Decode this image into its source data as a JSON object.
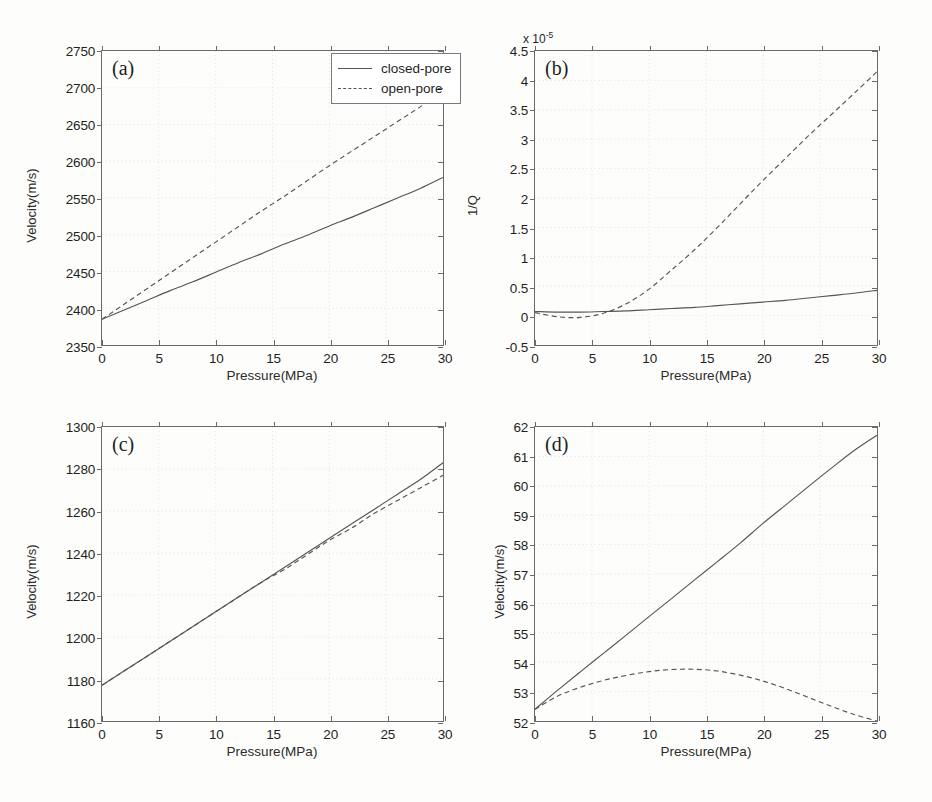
{
  "figure": {
    "background": "#fdfdfb",
    "axis_color": "#6a6a6a",
    "curve_color": "#555555"
  },
  "legend": {
    "entries": [
      {
        "label": "closed-pore",
        "style": "solid"
      },
      {
        "label": "open-pore",
        "style": "dashed"
      }
    ],
    "position": "top-right of panel (a)"
  },
  "chart_data": [
    {
      "type": "line",
      "panel": "a",
      "tag": "(a)",
      "title": "",
      "xlabel": "Pressure(MPa)",
      "ylabel": "Velocity(m/s)",
      "xlim": [
        0,
        30
      ],
      "ylim": [
        2350,
        2750
      ],
      "xticks": [
        0,
        5,
        10,
        15,
        20,
        25,
        30
      ],
      "yticks": [
        2350,
        2400,
        2450,
        2500,
        2550,
        2600,
        2650,
        2700,
        2750
      ],
      "grid": true,
      "x": [
        0,
        2,
        4,
        6,
        8,
        10,
        12,
        14,
        16,
        18,
        20,
        22,
        24,
        26,
        28,
        30
      ],
      "series": [
        {
          "name": "closed-pore",
          "style": "solid",
          "values": [
            2385,
            2398,
            2411,
            2424,
            2436,
            2449,
            2462,
            2474,
            2487,
            2499,
            2512,
            2524,
            2537,
            2550,
            2563,
            2578
          ]
        },
        {
          "name": "open-pore",
          "style": "dashed",
          "values": [
            2385,
            2406,
            2427,
            2448,
            2469,
            2490,
            2511,
            2532,
            2552,
            2573,
            2594,
            2614,
            2634,
            2654,
            2674,
            2694
          ]
        }
      ]
    },
    {
      "type": "line",
      "panel": "b",
      "tag": "(b)",
      "title": "",
      "xlabel": "Pressure(MPa)",
      "ylabel": "1/Q",
      "y_exponent_label": "x 10",
      "y_exponent_value": "-5",
      "xlim": [
        0,
        30
      ],
      "ylim": [
        -0.5,
        4.5
      ],
      "xticks": [
        0,
        5,
        10,
        15,
        20,
        25,
        30
      ],
      "yticks": [
        -0.5,
        0,
        0.5,
        1,
        1.5,
        2,
        2.5,
        3,
        3.5,
        4,
        4.5
      ],
      "grid": true,
      "x": [
        0,
        2,
        4,
        6,
        8,
        10,
        12,
        14,
        16,
        18,
        20,
        22,
        24,
        26,
        28,
        30
      ],
      "series": [
        {
          "name": "closed-pore",
          "style": "solid",
          "values": [
            0.07,
            0.06,
            0.06,
            0.07,
            0.08,
            0.1,
            0.12,
            0.14,
            0.17,
            0.2,
            0.23,
            0.26,
            0.3,
            0.34,
            0.38,
            0.43
          ]
        },
        {
          "name": "open-pore",
          "style": "dashed",
          "values": [
            0.05,
            -0.02,
            -0.03,
            0.04,
            0.2,
            0.45,
            0.78,
            1.12,
            1.5,
            1.9,
            2.3,
            2.68,
            3.06,
            3.42,
            3.78,
            4.15
          ]
        }
      ]
    },
    {
      "type": "line",
      "panel": "c",
      "tag": "(c)",
      "title": "",
      "xlabel": "Pressure(MPa)",
      "ylabel": "Velocity(m/s)",
      "xlim": [
        0,
        30
      ],
      "ylim": [
        1160,
        1300
      ],
      "xticks": [
        0,
        5,
        10,
        15,
        20,
        25,
        30
      ],
      "yticks": [
        1160,
        1180,
        1200,
        1220,
        1240,
        1260,
        1280,
        1300
      ],
      "grid": true,
      "x": [
        0,
        2,
        4,
        6,
        8,
        10,
        12,
        14,
        16,
        18,
        20,
        22,
        24,
        26,
        28,
        30
      ],
      "series": [
        {
          "name": "closed-pore",
          "style": "solid",
          "values": [
            1177,
            1184,
            1191,
            1198,
            1205,
            1212,
            1219,
            1226,
            1233,
            1240,
            1247,
            1254,
            1261,
            1268,
            1275,
            1283
          ]
        },
        {
          "name": "open-pore",
          "style": "dashed",
          "values": [
            1177,
            1184,
            1191,
            1198,
            1205,
            1212,
            1219,
            1226,
            1232,
            1239,
            1246,
            1252,
            1259,
            1265,
            1271,
            1277
          ]
        }
      ]
    },
    {
      "type": "line",
      "panel": "d",
      "tag": "(d)",
      "title": "",
      "xlabel": "Pressure(MPa)",
      "ylabel": "Velocity(m/s)",
      "xlim": [
        0,
        30
      ],
      "ylim": [
        52,
        62
      ],
      "xticks": [
        0,
        5,
        10,
        15,
        20,
        25,
        30
      ],
      "yticks": [
        52,
        53,
        54,
        55,
        56,
        57,
        58,
        59,
        60,
        61,
        62
      ],
      "grid": true,
      "x": [
        0,
        2,
        4,
        6,
        8,
        10,
        12,
        14,
        16,
        18,
        20,
        22,
        24,
        26,
        28,
        30
      ],
      "series": [
        {
          "name": "closed-pore",
          "style": "solid",
          "values": [
            52.4,
            53.05,
            53.68,
            54.3,
            54.92,
            55.55,
            56.17,
            56.8,
            57.42,
            58.05,
            58.72,
            59.35,
            59.98,
            60.6,
            61.2,
            61.72
          ]
        },
        {
          "name": "open-pore",
          "style": "dashed",
          "values": [
            52.4,
            52.85,
            53.15,
            53.38,
            53.55,
            53.68,
            53.75,
            53.76,
            53.7,
            53.56,
            53.36,
            53.1,
            52.8,
            52.5,
            52.22,
            52.0
          ]
        }
      ]
    }
  ]
}
